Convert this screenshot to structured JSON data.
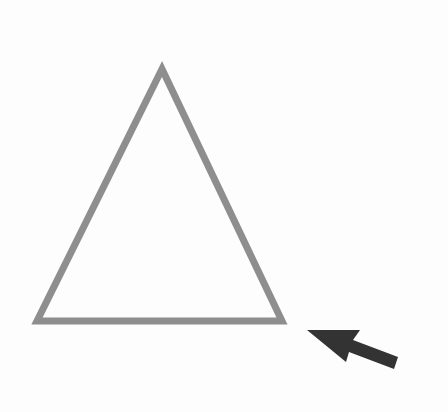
{
  "diagram": {
    "background": "#fdfdfd",
    "shapes": [
      {
        "kind": "triangle",
        "name": "outline-triangle",
        "points": "162,69 37,321 282,321",
        "stroke": "#8e8e8e",
        "stroke_width": 7,
        "fill": "none"
      }
    ],
    "arrow": {
      "name": "pointer-arrow",
      "points": "307,330 360,330 353,340 398,357 394,369 349,352 346,362",
      "fill": "#333333",
      "direction": "points up-left toward the triangle's bottom-right corner"
    }
  }
}
